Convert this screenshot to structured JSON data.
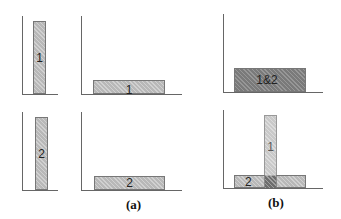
{
  "panels": {
    "a_top_left": {
      "bar_label": "1"
    },
    "a_top_mid": {
      "bar_label": "1"
    },
    "a_bot_left": {
      "bar_label": "2"
    },
    "a_bot_mid": {
      "bar_label": "2"
    },
    "b_top": {
      "bar_label": "1&2"
    },
    "b_bot": {
      "bar1_label": "1",
      "bar2_label": "2"
    }
  },
  "captions": {
    "a": "(a)",
    "b": "(b)"
  },
  "colors": {
    "bar_fill": "#b8b8b8",
    "bar_dark": "#7a7a7a",
    "axis": "#666666"
  }
}
